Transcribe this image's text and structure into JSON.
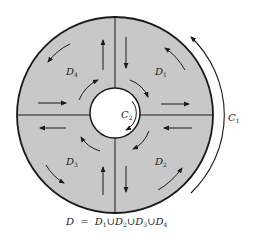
{
  "diagram": {
    "type": "annulus-region-decomposition",
    "fill_color": "#c8c8c8",
    "line_color": "#1a1a1a",
    "regions": [
      {
        "label": "D",
        "sub": "1"
      },
      {
        "label": "D",
        "sub": "2"
      },
      {
        "label": "D",
        "sub": "3"
      },
      {
        "label": "D",
        "sub": "4"
      }
    ],
    "curves": [
      {
        "label": "C",
        "sub": "1",
        "direction": "counterclockwise"
      },
      {
        "label": "C",
        "sub": "2",
        "direction": "clockwise"
      }
    ],
    "caption": {
      "lhs": "D",
      "equals": "=",
      "union": "∪",
      "terms": [
        {
          "label": "D",
          "sub": "1"
        },
        {
          "label": "D",
          "sub": "2"
        },
        {
          "label": "D",
          "sub": "3"
        },
        {
          "label": "D",
          "sub": "4"
        }
      ]
    }
  }
}
